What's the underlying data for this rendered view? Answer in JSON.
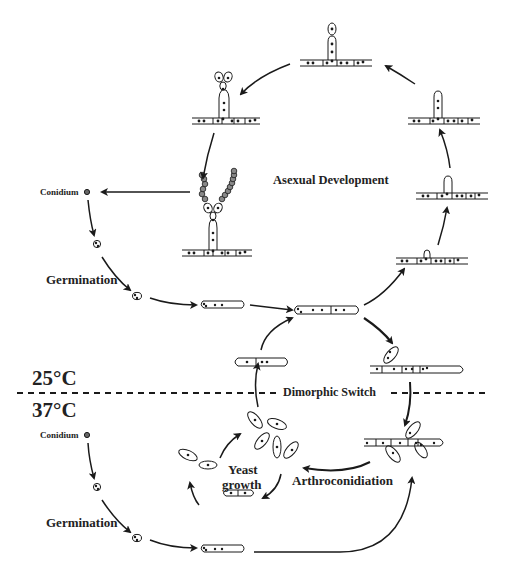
{
  "diagram": {
    "labels": {
      "asexual_development": "Asexual Development",
      "conidium_top": "Conidium",
      "germination_top": "Germination",
      "temp_25": "25°C",
      "temp_37": "37°C",
      "dimorphic_switch": "Dimorphic Switch",
      "conidium_bottom": "Conidium",
      "germination_bottom": "Germination",
      "yeast_growth_line1": "Yeast",
      "yeast_growth_line2": "growth",
      "arthroconidiation": "Arthroconidiation"
    },
    "stages": {
      "upper_cycle": [
        "Conidium",
        "Germination",
        "Germ tube",
        "Hypha",
        "Branching hypha",
        "Aerial bud",
        "Conidiophore",
        "Vesicle",
        "Phialides",
        "Conidia chains"
      ],
      "lower_cycle": [
        "Conidium",
        "Germination",
        "Germ tube",
        "Hypha",
        "Arthroconidia",
        "Yeast cells",
        "Budding yeast"
      ]
    },
    "colors": {
      "line": "#1a1a1a",
      "background": "#ffffff",
      "nucleus": "#222222"
    }
  }
}
